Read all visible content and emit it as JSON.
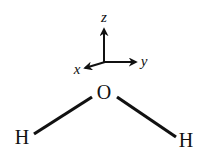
{
  "diagram": {
    "axes": {
      "z_label": "z",
      "y_label": "y",
      "x_label": "x"
    },
    "atoms": {
      "center": "O",
      "left": "H",
      "right": "H"
    },
    "colors": {
      "ink": "#111111",
      "background": "#ffffff"
    }
  }
}
